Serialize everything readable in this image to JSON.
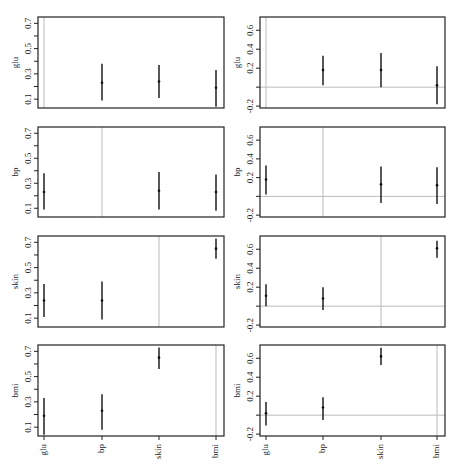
{
  "figure": {
    "layout": "4 rows x 2 columns of interval plots",
    "categories": [
      "glu",
      "bp",
      "skin",
      "bmi"
    ],
    "colors": {
      "axis": "#222222",
      "interval": "#111111",
      "reference_line": "#bbbbbb",
      "background": "#ffffff"
    }
  },
  "chart_data": [
    {
      "type": "interval",
      "panel": "row1-left",
      "ylabel": "glu",
      "categories": [
        "glu",
        "bp",
        "skin",
        "bmi"
      ],
      "yticks": [
        0.1,
        0.3,
        0.5,
        0.7
      ],
      "ylim": [
        0.03,
        0.75
      ],
      "reference_vline": "glu",
      "reference_hline": null,
      "points": [
        {
          "category": "bp",
          "estimate": 0.23,
          "lower": 0.09,
          "upper": 0.38
        },
        {
          "category": "skin",
          "estimate": 0.24,
          "lower": 0.11,
          "upper": 0.37
        },
        {
          "category": "bmi",
          "estimate": 0.19,
          "lower": 0.04,
          "upper": 0.33
        }
      ]
    },
    {
      "type": "interval",
      "panel": "row1-right",
      "ylabel": "glu",
      "categories": [
        "glu",
        "bp",
        "skin",
        "bmi"
      ],
      "yticks": [
        -0.2,
        0.2,
        0.4,
        0.6
      ],
      "ylim": [
        -0.22,
        0.74
      ],
      "reference_vline": "glu",
      "reference_hline": 0,
      "points": [
        {
          "category": "bp",
          "estimate": 0.18,
          "lower": 0.02,
          "upper": 0.33
        },
        {
          "category": "skin",
          "estimate": 0.18,
          "lower": 0.0,
          "upper": 0.36
        },
        {
          "category": "bmi",
          "estimate": 0.02,
          "lower": -0.18,
          "upper": 0.22
        }
      ]
    },
    {
      "type": "interval",
      "panel": "row2-left",
      "ylabel": "bp",
      "categories": [
        "glu",
        "bp",
        "skin",
        "bmi"
      ],
      "yticks": [
        0.1,
        0.3,
        0.5,
        0.7
      ],
      "ylim": [
        0.03,
        0.75
      ],
      "reference_vline": "bp",
      "reference_hline": null,
      "points": [
        {
          "category": "glu",
          "estimate": 0.23,
          "lower": 0.09,
          "upper": 0.38
        },
        {
          "category": "skin",
          "estimate": 0.24,
          "lower": 0.09,
          "upper": 0.39
        },
        {
          "category": "bmi",
          "estimate": 0.23,
          "lower": 0.08,
          "upper": 0.37
        }
      ]
    },
    {
      "type": "interval",
      "panel": "row2-right",
      "ylabel": "bp",
      "categories": [
        "glu",
        "bp",
        "skin",
        "bmi"
      ],
      "yticks": [
        -0.2,
        0.2,
        0.4,
        0.6
      ],
      "ylim": [
        -0.22,
        0.74
      ],
      "reference_vline": "bp",
      "reference_hline": 0,
      "points": [
        {
          "category": "glu",
          "estimate": 0.18,
          "lower": 0.02,
          "upper": 0.33
        },
        {
          "category": "skin",
          "estimate": 0.13,
          "lower": -0.07,
          "upper": 0.32
        },
        {
          "category": "bmi",
          "estimate": 0.12,
          "lower": -0.08,
          "upper": 0.31
        }
      ]
    },
    {
      "type": "interval",
      "panel": "row3-left",
      "ylabel": "skin",
      "categories": [
        "glu",
        "bp",
        "skin",
        "bmi"
      ],
      "yticks": [
        0.1,
        0.3,
        0.5,
        0.7
      ],
      "ylim": [
        0.03,
        0.75
      ],
      "reference_vline": "skin",
      "reference_hline": null,
      "points": [
        {
          "category": "glu",
          "estimate": 0.24,
          "lower": 0.11,
          "upper": 0.37
        },
        {
          "category": "bp",
          "estimate": 0.24,
          "lower": 0.09,
          "upper": 0.39
        },
        {
          "category": "bmi",
          "estimate": 0.65,
          "lower": 0.57,
          "upper": 0.73
        }
      ]
    },
    {
      "type": "interval",
      "panel": "row3-right",
      "ylabel": "skin",
      "categories": [
        "glu",
        "bp",
        "skin",
        "bmi"
      ],
      "yticks": [
        -0.2,
        0.2,
        0.4,
        0.6
      ],
      "ylim": [
        -0.22,
        0.74
      ],
      "reference_vline": "skin",
      "reference_hline": 0,
      "points": [
        {
          "category": "glu",
          "estimate": 0.11,
          "lower": 0.0,
          "upper": 0.23
        },
        {
          "category": "bp",
          "estimate": 0.08,
          "lower": -0.04,
          "upper": 0.2
        },
        {
          "category": "bmi",
          "estimate": 0.61,
          "lower": 0.51,
          "upper": 0.69
        }
      ]
    },
    {
      "type": "interval",
      "panel": "row4-left",
      "ylabel": "bmi",
      "categories": [
        "glu",
        "bp",
        "skin",
        "bmi"
      ],
      "yticks": [
        0.1,
        0.3,
        0.5,
        0.7
      ],
      "ylim": [
        0.03,
        0.75
      ],
      "reference_vline": "bmi",
      "reference_hline": null,
      "points": [
        {
          "category": "glu",
          "estimate": 0.19,
          "lower": 0.04,
          "upper": 0.33
        },
        {
          "category": "bp",
          "estimate": 0.23,
          "lower": 0.08,
          "upper": 0.36
        },
        {
          "category": "skin",
          "estimate": 0.65,
          "lower": 0.56,
          "upper": 0.73
        }
      ]
    },
    {
      "type": "interval",
      "panel": "row4-right",
      "ylabel": "bmi",
      "categories": [
        "glu",
        "bp",
        "skin",
        "bmi"
      ],
      "yticks": [
        -0.2,
        0.2,
        0.4,
        0.6
      ],
      "ylim": [
        -0.22,
        0.74
      ],
      "reference_vline": "bmi",
      "reference_hline": 0,
      "points": [
        {
          "category": "glu",
          "estimate": 0.02,
          "lower": -0.11,
          "upper": 0.14
        },
        {
          "category": "bp",
          "estimate": 0.08,
          "lower": -0.05,
          "upper": 0.19
        },
        {
          "category": "skin",
          "estimate": 0.62,
          "lower": 0.53,
          "upper": 0.71
        }
      ]
    }
  ]
}
